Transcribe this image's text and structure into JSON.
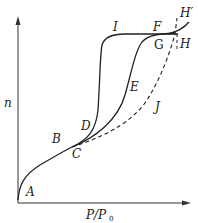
{
  "diagram": {
    "type": "adsorption-isotherm-hysteresis",
    "axes": {
      "y_label": "n",
      "x_label_main": "P/P",
      "x_label_sub": "0"
    },
    "point_labels": {
      "A": "A",
      "B": "B",
      "C": "C",
      "D": "D",
      "E": "E",
      "F": "F",
      "G": "G",
      "H": "H",
      "H_prime": "H′",
      "I": "I",
      "J": "J"
    },
    "colors": {
      "line": "#222222",
      "background": "#ffffff"
    }
  }
}
